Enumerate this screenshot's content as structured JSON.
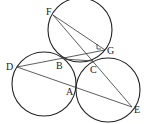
{
  "diagram": {
    "type": "geometry",
    "circles": [
      {
        "name": "top",
        "cx": 80,
        "cy": 30,
        "r": 32
      },
      {
        "name": "left",
        "cx": 44,
        "cy": 84,
        "r": 32
      },
      {
        "name": "right",
        "cx": 108,
        "cy": 90,
        "r": 32
      }
    ],
    "points": {
      "F": {
        "x": 53,
        "y": 15,
        "label": "F",
        "lx": 46,
        "ly": 15
      },
      "G": {
        "x": 105,
        "y": 50,
        "label": "G",
        "lx": 107,
        "ly": 54
      },
      "B": {
        "x": 64,
        "y": 59,
        "label": "B",
        "lx": 56,
        "ly": 69
      },
      "C": {
        "x": 93,
        "y": 61,
        "label": "C",
        "lx": 90,
        "ly": 73
      },
      "D": {
        "x": 17,
        "y": 67,
        "label": "D",
        "lx": 6,
        "ly": 70
      },
      "A": {
        "x": 76,
        "y": 88,
        "label": "A",
        "lx": 66,
        "ly": 95
      },
      "E": {
        "x": 132,
        "y": 107,
        "label": "E",
        "lx": 134,
        "ly": 113
      }
    },
    "segments": [
      [
        "F",
        "G"
      ],
      [
        "F",
        "E"
      ],
      [
        "D",
        "G"
      ],
      [
        "D",
        "E"
      ],
      [
        "B",
        "C"
      ]
    ]
  }
}
